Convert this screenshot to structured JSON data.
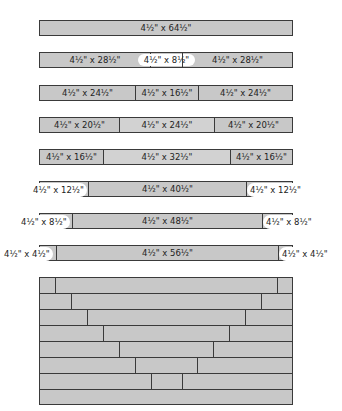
{
  "diagram": {
    "type": "quilt-strip-cutting-layout",
    "strip_height": "4½\"",
    "rows": [
      {
        "pieces": [
          {
            "label": "4½\" x 64½\""
          }
        ]
      },
      {
        "pieces": [
          {
            "label": "4½\" x 28½\""
          },
          {
            "label": "4½\" x 8½\"",
            "highlight": true
          },
          {
            "label": "4½\" x 28½\""
          }
        ]
      },
      {
        "pieces": [
          {
            "label": "4½\" x 24½\""
          },
          {
            "label": "4½\" x 16½\""
          },
          {
            "label": "4½\" x 24½\""
          }
        ]
      },
      {
        "pieces": [
          {
            "label": "4½\" x 20½\""
          },
          {
            "label": "4½\" x 24½\""
          },
          {
            "label": "4½\" x 20½\""
          }
        ]
      },
      {
        "pieces": [
          {
            "label": "4½\" x 16½\""
          },
          {
            "label": "4½\" x 32½\""
          },
          {
            "label": "4½\" x 16½\""
          }
        ]
      },
      {
        "pieces": [
          {
            "label": "4½\" x 12½\""
          },
          {
            "label": "4½\" x 40½\""
          },
          {
            "label": "4½\" x 12½\""
          }
        ]
      },
      {
        "pieces": [
          {
            "label": "4½\" x 8½\""
          },
          {
            "label": "4½\" x 48½\""
          },
          {
            "label": "4½\" x 8½\""
          }
        ]
      },
      {
        "pieces": [
          {
            "label": "4½\" x 4½\""
          },
          {
            "label": "4½\" x 56½\""
          },
          {
            "label": "4½\" x 4½\""
          }
        ]
      }
    ],
    "assembled_quilt": {
      "rows": 8,
      "description": "Assembled strips forming a V-shaped seam pattern"
    }
  }
}
